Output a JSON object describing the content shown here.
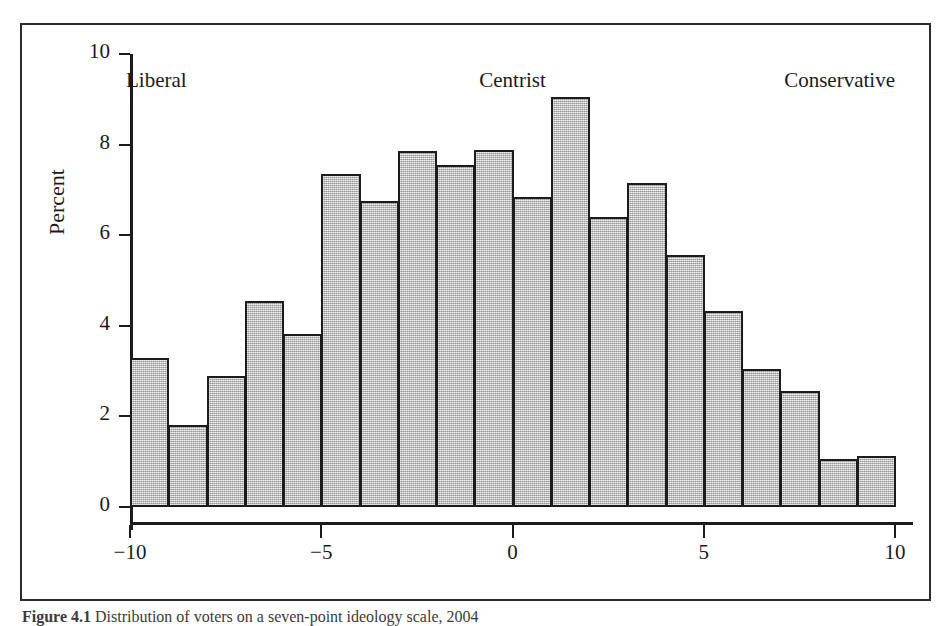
{
  "figure": {
    "caption_label": "Figure 4.1",
    "caption_text": "Distribution of voters on a seven-point ideology scale, 2004"
  },
  "chart_data": {
    "type": "bar",
    "title": "",
    "subtitle": "",
    "xlabel": "",
    "ylabel": "Percent",
    "xlim": [
      -10,
      10
    ],
    "ylim": [
      0,
      10
    ],
    "grid": false,
    "legend": null,
    "y_ticks": [
      0,
      2,
      4,
      6,
      8,
      10
    ],
    "y_tick_labels": [
      "0",
      "2",
      "4",
      "6",
      "8",
      "10"
    ],
    "x_ticks": [
      -10,
      -5,
      0,
      5,
      10
    ],
    "x_tick_labels": [
      "−10",
      "−5",
      "0",
      "5",
      "10"
    ],
    "x_anchor_labels": [
      {
        "text": "Liberal",
        "at": -10,
        "align": "left"
      },
      {
        "text": "Centrist",
        "at": 0,
        "align": "center"
      },
      {
        "text": "Conservative",
        "at": 10,
        "align": "right"
      }
    ],
    "bin_width": 1,
    "bin_starts": [
      -10,
      -9,
      -8,
      -7,
      -6,
      -5,
      -4,
      -3,
      -2,
      -1,
      0,
      1,
      2,
      3,
      4,
      5,
      6,
      7,
      8,
      9
    ],
    "categories": [
      "-10",
      "-9",
      "-8",
      "-7",
      "-6",
      "-5",
      "-4",
      "-3",
      "-2",
      "-1",
      "0",
      "1",
      "2",
      "3",
      "4",
      "5",
      "6",
      "7",
      "8",
      "9"
    ],
    "values": [
      3.29,
      1.8,
      2.89,
      4.55,
      3.83,
      7.35,
      6.76,
      7.86,
      7.55,
      7.89,
      6.85,
      9.05,
      6.4,
      7.15,
      5.56,
      4.33,
      3.05,
      2.56,
      1.05,
      1.12
    ],
    "bar_fill_color": "#b9b9b9",
    "bar_edge_color": "#1c1c1c"
  }
}
